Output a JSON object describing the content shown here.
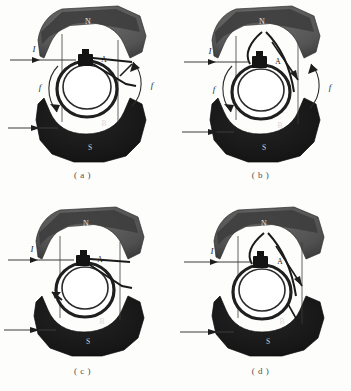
{
  "figure": {
    "domain": "scanned-textbook-diagram",
    "background_color": "#fdfdfc",
    "panel_count": 4
  },
  "colors": {
    "north_pole_fill": "#5d5d5d",
    "north_pole_shadow": "#3a3a3a",
    "south_pole_fill": "#1b1b1b",
    "south_pole_shadow": "#101010",
    "coil_stroke": "#2a2a2a",
    "coil_fill": "#ffffff",
    "lead_line": "#3c3c3c",
    "label_light": "#e8e8e8",
    "label_dark": "#2b2b2b",
    "caption_color": "#4e4e4e",
    "page_background": "#fdfdfc"
  },
  "labels": {
    "north_pole": "N",
    "south_pole": "S",
    "coil_side_a": "A",
    "coil_side_b": "B",
    "current": "I",
    "force": "f"
  },
  "panels": [
    {
      "id": "a",
      "caption": "( a )",
      "position": "top-left",
      "pole_top": "N",
      "pole_bottom": "S",
      "coil_label_top": "A",
      "coil_label_bottom": "B",
      "current_label": "I",
      "force_label_left": "f",
      "force_label_right": "f",
      "has_force_arrows": true,
      "has_upper_lead_arrow": true,
      "has_lower_lead_arrow": true,
      "coil_rotation_deg": 0,
      "description": "Coil plane vertical, brushes contacting commutator, forces shown on both coil sides"
    },
    {
      "id": "b",
      "caption": "( b )",
      "position": "top-right",
      "pole_top": "N",
      "pole_bottom": "S",
      "coil_label_top": "A",
      "coil_label_bottom": "B",
      "current_label": "I",
      "force_label_left": "f",
      "force_label_right": "f",
      "has_force_arrows": true,
      "has_upper_lead_arrow": true,
      "has_lower_lead_arrow": true,
      "coil_rotation_deg": 25,
      "description": "Coil rotated, leads crossing, forces still acting in same rotational sense"
    },
    {
      "id": "c",
      "caption": "( c )",
      "position": "bottom-left",
      "pole_top": "N",
      "pole_bottom": "S",
      "coil_label_top": "A",
      "coil_label_bottom": "B",
      "current_label": "I",
      "force_label_left": "",
      "force_label_right": "",
      "has_force_arrows": false,
      "has_upper_lead_arrow": true,
      "has_lower_lead_arrow": true,
      "coil_rotation_deg": 0,
      "description": "Coil at neutral plane, no force labels shown, single short arrow at left of coil"
    },
    {
      "id": "d",
      "caption": "( d )",
      "position": "bottom-right",
      "pole_top": "N",
      "pole_bottom": "S",
      "coil_label_top": "A",
      "coil_label_bottom": "B",
      "current_label": "I",
      "force_label_left": "",
      "force_label_right": "",
      "has_force_arrows": false,
      "has_upper_lead_arrow": true,
      "has_lower_lead_arrow": true,
      "coil_rotation_deg": 25,
      "description": "Coil rotated past neutral, commutator reverses, leads crossed"
    }
  ]
}
